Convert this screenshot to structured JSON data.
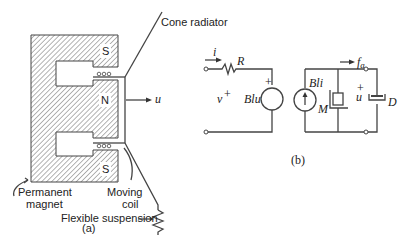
{
  "figure_a": {
    "caption": "(a)",
    "labels": {
      "cone": "Cone radiator",
      "magnet_line1": "Permanent",
      "magnet_line2": "magnet",
      "coil_line1": "Moving",
      "coil_line2": "coil",
      "suspension": "Flexible suspension",
      "velocity": "u"
    },
    "poles": {
      "top": "S",
      "middle": "N",
      "bottom": "S"
    }
  },
  "figure_b": {
    "caption": "(b)",
    "electrical": {
      "current": "i",
      "resistor": "R",
      "voltage": "v",
      "voltage_sign": "+",
      "source": "Blu",
      "source_plus": "+"
    },
    "mechanical": {
      "force": "f",
      "force_sub": "a",
      "current_source": "Bli",
      "mass": "M",
      "velocity": "u",
      "velocity_sign": "+",
      "damper": "D"
    }
  }
}
